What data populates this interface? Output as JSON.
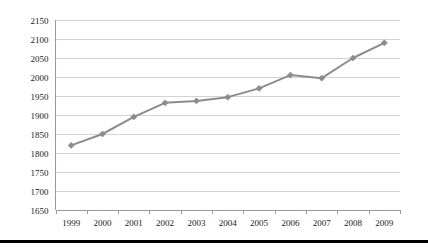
{
  "chart_data": {
    "type": "line",
    "title": "",
    "subtitle": "",
    "xlabel": "",
    "ylabel": "",
    "categories": [
      "1999",
      "2000",
      "2001",
      "2002",
      "2003",
      "2004",
      "2005",
      "2006",
      "2007",
      "2008",
      "2009"
    ],
    "series": [
      {
        "name": "",
        "values": [
          1820,
          1850,
          1895,
          1932,
          1937,
          1947,
          1970,
          2005,
          1997,
          2050,
          2090
        ]
      }
    ],
    "ylim": [
      1650,
      2150
    ],
    "ytick_step": 50,
    "ytick_labels": [
      "2150",
      "2100",
      "2050",
      "2000",
      "1950",
      "1900",
      "1850",
      "1800",
      "1750",
      "1700",
      "1650"
    ],
    "grid": "horizontal",
    "legend": "none",
    "marker": "diamond",
    "colors": {
      "series_line": "#8c8c8c",
      "marker": "#8c8c8c",
      "gridline": "#c8c8c8",
      "axis": "#9a9a9a",
      "text": "#1a1a1a",
      "rule": "#000000",
      "background": "#ffffff"
    }
  },
  "figure": {
    "bottom_rule_present": true
  }
}
